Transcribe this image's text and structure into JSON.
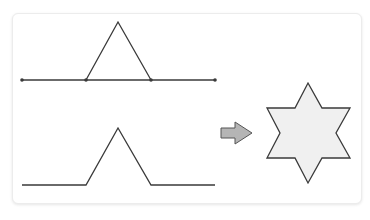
{
  "diagram": {
    "colors": {
      "stroke": "#3a3a3a",
      "star_fill": "#f0f0f0",
      "arrow_fill": "#b5b5b5",
      "arrow_stroke": "#555555",
      "card_border": "#ececec"
    },
    "top_figure": {
      "description": "Segment divided in thirds with equilateral triangle on middle third",
      "line": [
        [
          22,
          80
        ],
        [
          215,
          80
        ]
      ],
      "dots": [
        [
          22,
          80
        ],
        [
          86,
          80
        ],
        [
          151,
          80
        ],
        [
          215,
          80
        ]
      ],
      "triangle": [
        [
          86,
          80
        ],
        [
          118,
          22
        ],
        [
          151,
          80
        ]
      ]
    },
    "bottom_figure": {
      "description": "Resulting Koch curve with middle third replaced",
      "path": [
        [
          22,
          185
        ],
        [
          86,
          185
        ],
        [
          118,
          128
        ],
        [
          151,
          185
        ],
        [
          215,
          185
        ]
      ]
    },
    "arrow": {
      "direction": "right",
      "points": [
        [
          221,
          128
        ],
        [
          235,
          128
        ],
        [
          235,
          122
        ],
        [
          252,
          133
        ],
        [
          235,
          144
        ],
        [
          235,
          138
        ],
        [
          221,
          138
        ]
      ]
    },
    "star": {
      "description": "Six-pointed star (first iteration of Koch snowflake)",
      "points": [
        [
          308,
          83
        ],
        [
          322,
          108
        ],
        [
          350,
          108
        ],
        [
          336,
          133
        ],
        [
          350,
          158
        ],
        [
          322,
          158
        ],
        [
          308,
          183
        ],
        [
          295,
          158
        ],
        [
          267,
          158
        ],
        [
          280,
          133
        ],
        [
          267,
          108
        ],
        [
          295,
          108
        ]
      ]
    }
  }
}
